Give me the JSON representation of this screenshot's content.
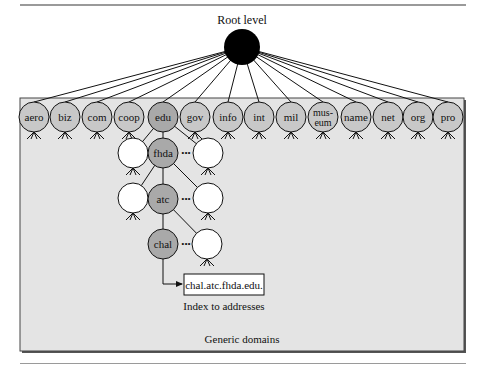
{
  "figure": {
    "root_label": "Root level",
    "region_label": "Generic domains",
    "index_label": "Index to addresses",
    "address_box": "chal.atc.fhda.edu.",
    "ellipsis": "•••"
  },
  "colors": {
    "background": "#ffffff",
    "region_fill": "#e4e4e4",
    "region_border": "#333333",
    "node_fill": "#c8c8c8",
    "path_node_fill": "#a9a9a9",
    "blank_node_fill": "#ffffff",
    "root_fill": "#000000",
    "line": "#111111"
  },
  "top_level_domains": [
    {
      "label": "aero",
      "x": 34
    },
    {
      "label": "biz",
      "x": 65
    },
    {
      "label": "com",
      "x": 97
    },
    {
      "label": "coop",
      "x": 129
    },
    {
      "label": "edu",
      "x": 163,
      "highlight": true
    },
    {
      "label": "gov",
      "x": 195
    },
    {
      "label": "info",
      "x": 228
    },
    {
      "label": "int",
      "x": 259
    },
    {
      "label": "mil",
      "x": 291
    },
    {
      "label": "mus-\neum",
      "line1": "mus-",
      "line2": "eum",
      "x": 323
    },
    {
      "label": "name",
      "x": 356
    },
    {
      "label": "net",
      "x": 388
    },
    {
      "label": "org",
      "x": 418
    },
    {
      "label": "pro",
      "x": 448
    }
  ],
  "path_nodes": [
    {
      "label": "fhda",
      "x": 163,
      "y": 153
    },
    {
      "label": "atc",
      "x": 163,
      "y": 199
    },
    {
      "label": "chal",
      "x": 163,
      "y": 244
    }
  ]
}
